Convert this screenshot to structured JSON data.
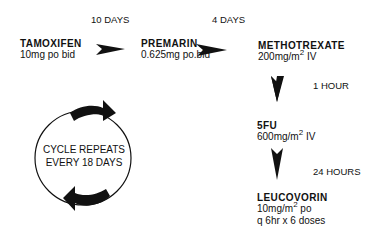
{
  "timeline": {
    "interval_1": "10 DAYS",
    "interval_2": "4 DAYS",
    "interval_3": "1 HOUR",
    "interval_4": "24 HOURS"
  },
  "drugs": [
    {
      "name": "TAMOXIFEN",
      "dose": "10mg po bid"
    },
    {
      "name": "PREMARIN",
      "dose": "0.625mg po.bid"
    },
    {
      "name": "METHOTREXATE",
      "dose_prefix": "200mg/m",
      "dose_sup": "2",
      "dose_suffix": " IV"
    },
    {
      "name": "5FU",
      "dose_prefix": "600mg/m",
      "dose_sup": "2",
      "dose_suffix": " IV"
    },
    {
      "name": "LEUCOVORIN",
      "dose_prefix": "10mg/m",
      "dose_sup": "2",
      "dose_suffix": " po",
      "dose_line2": "q 6hr x 6 doses"
    }
  ],
  "cycle": {
    "line1": "CYCLE REPEATS",
    "line2": "EVERY 18 DAYS"
  }
}
